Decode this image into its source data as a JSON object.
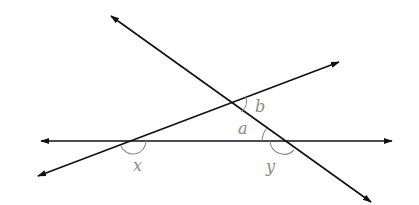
{
  "diagram": {
    "type": "geometry-lines-and-angles",
    "colors": {
      "line": "#111111",
      "arc": "#8a8a8a",
      "label": "#8a8a8a",
      "background": "#ffffff"
    },
    "lines": [
      {
        "name": "horizontal-line",
        "from": [
          41,
          141
        ],
        "to": [
          392,
          141
        ],
        "arrows": "both"
      },
      {
        "name": "rising-line",
        "from": [
          38,
          176
        ],
        "to": [
          339,
          62
        ],
        "arrows": "both"
      },
      {
        "name": "falling-line",
        "from": [
          111,
          16
        ],
        "to": [
          371,
          202
        ],
        "arrows": "both"
      }
    ],
    "labels": {
      "a": "a",
      "b": "b",
      "x": "x",
      "y": "y"
    }
  }
}
